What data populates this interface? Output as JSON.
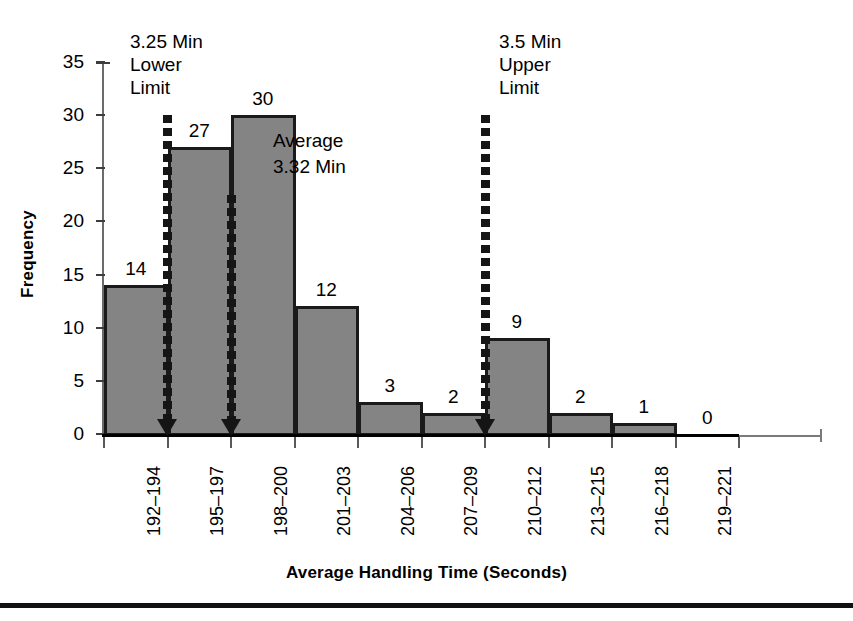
{
  "chart_data": {
    "type": "bar",
    "title": "",
    "subtitle": "",
    "xlabel": "Average Handling Time (Seconds)",
    "ylabel": "Frequency",
    "categories": [
      "192–194",
      "195–197",
      "198–200",
      "201–203",
      "204–206",
      "207–209",
      "210–212",
      "213–215",
      "216–218",
      "219–221"
    ],
    "values": [
      14,
      27,
      30,
      12,
      3,
      2,
      9,
      2,
      1,
      0
    ],
    "value_labels": [
      "14",
      "27",
      "30",
      "12",
      "3",
      "2",
      "9",
      "2",
      "1",
      "0"
    ],
    "ylim": [
      0,
      35
    ],
    "ytick_labels": [
      "0",
      "5",
      "10",
      "15",
      "20",
      "25",
      "30",
      "35"
    ],
    "ytick_values": [
      0,
      5,
      10,
      15,
      20,
      25,
      30,
      35
    ],
    "grid": false,
    "legend": "none",
    "bar_fill_color": "#848484",
    "bar_border_color": "#1a1a1a",
    "annotation_color": "#151515",
    "annotations": [
      {
        "id": "lower-limit",
        "text": "3.25 Min\nLower\nLimit",
        "arrow_at_category_boundary": "192–194 / 195–197",
        "arrow_top_value": 30
      },
      {
        "id": "average",
        "text": "Average\n3.32 Min",
        "arrow_at_category_boundary": "195–197 / 198–200",
        "arrow_top_value": 22.5
      },
      {
        "id": "upper-limit",
        "text": "3.5 Min\nUpper\nLimit",
        "arrow_at_category_boundary": "207–209 / 210–212",
        "arrow_top_value": 30
      }
    ]
  },
  "axes": {
    "y_title": "Frequency",
    "x_title": "Average Handling Time (Seconds)"
  },
  "annotations": {
    "lower_limit": "3.25 Min\nLower\nLimit",
    "average": "Average\n3.32 Min",
    "upper_limit": "3.5 Min\nUpper\nLimit"
  }
}
